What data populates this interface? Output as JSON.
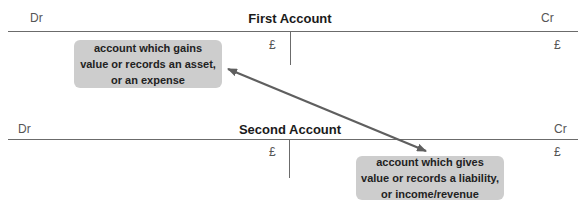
{
  "accounts": [
    {
      "title": "First Account",
      "debit_label": "Dr",
      "credit_label": "Cr",
      "debit_currency": "£",
      "credit_currency": "£"
    },
    {
      "title": "Second Account",
      "debit_label": "Dr",
      "credit_label": "Cr",
      "debit_currency": "£",
      "credit_currency": "£"
    }
  ],
  "callouts": {
    "debit": {
      "lines": [
        "account which gains",
        "value or records an asset,",
        "or an expense"
      ]
    },
    "credit": {
      "lines": [
        "account which gives",
        "value or records a liability,",
        "or income/revenue"
      ]
    }
  },
  "arrow": {
    "type": "double-headed",
    "color": "#5f5f5f"
  },
  "colors": {
    "callout_bg": "#cdcdcd",
    "rule": "#6b6b6b"
  }
}
